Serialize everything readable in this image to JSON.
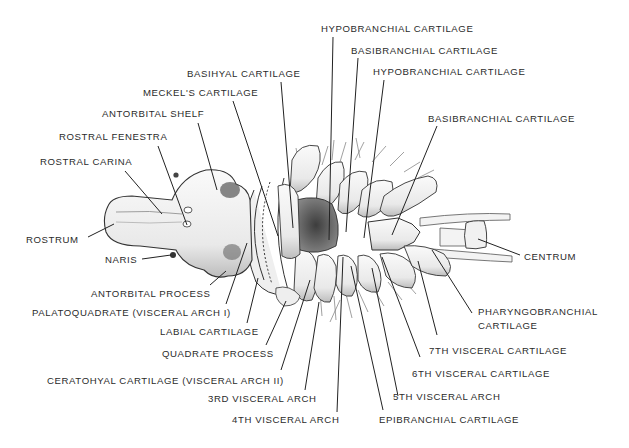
{
  "diagram": {
    "colors": {
      "background": "#ffffff",
      "ink": "#2b2b2b",
      "shade": "#555555",
      "cartilage": "#f2f2f2"
    }
  },
  "labels": [
    {
      "id": "hypobranchial-1",
      "text": "HYPOBRANCHIAL CARTILAGE",
      "x": 321,
      "y": 23
    },
    {
      "id": "basibranchial-1",
      "text": "BASIBRANCHIAL CARTILAGE",
      "x": 351,
      "y": 45
    },
    {
      "id": "basihyal",
      "text": "BASIHYAL CARTILAGE",
      "x": 187,
      "y": 68
    },
    {
      "id": "hypobranchial-2",
      "text": "HYPOBRANCHIAL CARTILAGE",
      "x": 373,
      "y": 66
    },
    {
      "id": "meckels",
      "text": "MECKEL'S CARTILAGE",
      "x": 143,
      "y": 87
    },
    {
      "id": "antorbital-shelf",
      "text": "ANTORBITAL SHELF",
      "x": 102,
      "y": 108
    },
    {
      "id": "basibranchial-2",
      "text": "BASIBRANCHIAL CARTILAGE",
      "x": 428,
      "y": 113
    },
    {
      "id": "rostral-fenestra",
      "text": "ROSTRAL FENESTRA",
      "x": 59,
      "y": 131
    },
    {
      "id": "rostral-carina",
      "text": "ROSTRAL CARINA",
      "x": 40,
      "y": 156
    },
    {
      "id": "rostrum",
      "text": "ROSTRUM",
      "x": 26,
      "y": 234
    },
    {
      "id": "centrum",
      "text": "CENTRUM",
      "x": 524,
      "y": 251
    },
    {
      "id": "naris",
      "text": "NARIS",
      "x": 105,
      "y": 254
    },
    {
      "id": "antorbital-process",
      "text": "ANTORBITAL PROCESS",
      "x": 91,
      "y": 288
    },
    {
      "id": "palatoquadrate",
      "text": "PALATOQUADRATE (VISCERAL ARCH I)",
      "x": 32,
      "y": 307
    },
    {
      "id": "pharyngobranchial",
      "text": "PHARYNGOBRANCHIAL",
      "x": 478,
      "y": 306
    },
    {
      "id": "pharyngobranchial-2",
      "text": "CARTILAGE",
      "x": 478,
      "y": 320
    },
    {
      "id": "labial",
      "text": "LABIAL CARTILAGE",
      "x": 160,
      "y": 326
    },
    {
      "id": "seventh-visceral",
      "text": "7TH  VISCERAL CARTILAGE",
      "x": 429,
      "y": 345
    },
    {
      "id": "quadrate-process",
      "text": "QUADRATE PROCESS",
      "x": 162,
      "y": 348
    },
    {
      "id": "sixth-visceral",
      "text": "6TH  VISCERAL CARTILAGE",
      "x": 412,
      "y": 368
    },
    {
      "id": "ceratohyal",
      "text": "CERATOHYAL CARTILAGE (VISCERAL ARCH II)",
      "x": 47,
      "y": 375
    },
    {
      "id": "third-arch",
      "text": "3RD  VISCERAL ARCH",
      "x": 208,
      "y": 393
    },
    {
      "id": "fifth-arch",
      "text": "5TH VISCERAL ARCH",
      "x": 393,
      "y": 391
    },
    {
      "id": "fourth-arch",
      "text": "4TH VISCERAL ARCH",
      "x": 232,
      "y": 414
    },
    {
      "id": "epibranchial",
      "text": "EPIBRANCHIAL CARTILAGE",
      "x": 379,
      "y": 414
    }
  ],
  "leaders": [
    {
      "id": "hypobranchial-1",
      "x1": 333,
      "y1": 37,
      "x2": 329,
      "y2": 240
    },
    {
      "id": "basibranchial-1",
      "x1": 358,
      "y1": 58,
      "x2": 346,
      "y2": 232
    },
    {
      "id": "basihyal",
      "x1": 281,
      "y1": 82,
      "x2": 293,
      "y2": 228
    },
    {
      "id": "hypobranchial-2",
      "x1": 384,
      "y1": 80,
      "x2": 364,
      "y2": 238
    },
    {
      "id": "meckels",
      "x1": 233,
      "y1": 101,
      "x2": 278,
      "y2": 236
    },
    {
      "id": "antorbital-shelf",
      "x1": 198,
      "y1": 123,
      "x2": 217,
      "y2": 190
    },
    {
      "id": "basibranchial-2",
      "x1": 437,
      "y1": 126,
      "x2": 392,
      "y2": 235
    },
    {
      "id": "rostral-fenestra",
      "x1": 158,
      "y1": 146,
      "x2": 187,
      "y2": 225
    },
    {
      "id": "rostral-carina",
      "x1": 125,
      "y1": 171,
      "x2": 162,
      "y2": 214
    },
    {
      "id": "rostrum",
      "x1": 88,
      "y1": 237,
      "x2": 114,
      "y2": 224
    },
    {
      "id": "centrum",
      "x1": 520,
      "y1": 255,
      "x2": 478,
      "y2": 239
    },
    {
      "id": "naris",
      "x1": 142,
      "y1": 259,
      "x2": 171,
      "y2": 255
    },
    {
      "id": "antorbital-process",
      "x1": 210,
      "y1": 285,
      "x2": 226,
      "y2": 271
    },
    {
      "id": "palatoquadrate",
      "x1": 226,
      "y1": 304,
      "x2": 247,
      "y2": 243
    },
    {
      "id": "pharyngobranchial",
      "x1": 472,
      "y1": 313,
      "x2": 432,
      "y2": 250
    },
    {
      "id": "labial",
      "x1": 247,
      "y1": 323,
      "x2": 258,
      "y2": 278
    },
    {
      "id": "seventh-visceral",
      "x1": 437,
      "y1": 335,
      "x2": 418,
      "y2": 261
    },
    {
      "id": "quadrate-process",
      "x1": 266,
      "y1": 345,
      "x2": 286,
      "y2": 301
    },
    {
      "id": "sixth-visceral",
      "x1": 420,
      "y1": 357,
      "x2": 382,
      "y2": 257
    },
    {
      "id": "ceratohyal",
      "x1": 281,
      "y1": 370,
      "x2": 310,
      "y2": 280
    },
    {
      "id": "third-arch",
      "x1": 305,
      "y1": 390,
      "x2": 319,
      "y2": 302
    },
    {
      "id": "fifth-arch",
      "x1": 398,
      "y1": 396,
      "x2": 372,
      "y2": 268
    },
    {
      "id": "fourth-arch",
      "x1": 337,
      "y1": 412,
      "x2": 343,
      "y2": 257
    },
    {
      "id": "epibranchial",
      "x1": 383,
      "y1": 410,
      "x2": 351,
      "y2": 266
    }
  ]
}
